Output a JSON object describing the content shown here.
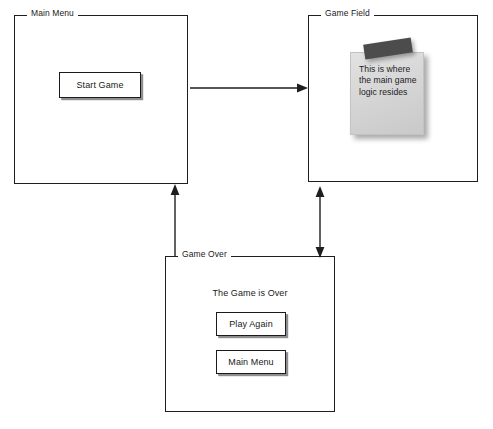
{
  "diagram": {
    "background_color": "#ffffff",
    "line_color": "#1e1e1e"
  },
  "panels": {
    "main_menu": {
      "label": "Main Menu",
      "button": {
        "label": "Start Game"
      }
    },
    "game_field": {
      "label": "Game Field",
      "note": {
        "text": "This is where the main game logic resides",
        "note_color": "#d6d6d6",
        "tape_color": "#4c4c4c"
      }
    },
    "game_over": {
      "label": "Game Over",
      "message": "The Game is Over",
      "buttons": [
        {
          "label": "Play Again"
        },
        {
          "label": "Main Menu"
        }
      ]
    }
  },
  "connectors": [
    {
      "name": "main-menu-to-game-field",
      "direction": "right",
      "heads": "single"
    },
    {
      "name": "game-field-to-game-over",
      "direction": "vertical",
      "heads": "double"
    },
    {
      "name": "game-over-to-main-menu",
      "direction": "up",
      "heads": "single"
    }
  ]
}
